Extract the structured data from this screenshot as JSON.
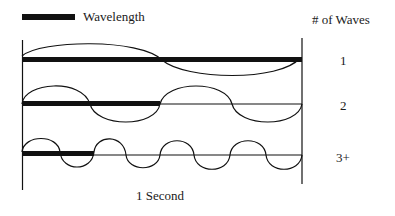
{
  "legend": {
    "label": "Wavelength"
  },
  "column_header": "# of Waves",
  "rows": [
    {
      "count_label": "1",
      "waves": 1
    },
    {
      "count_label": "2",
      "waves": 2
    },
    {
      "count_label": "3+",
      "waves": 4
    }
  ],
  "x_axis_label": "1 Second",
  "colors": {
    "ink": "#111111",
    "background": "#ffffff"
  }
}
